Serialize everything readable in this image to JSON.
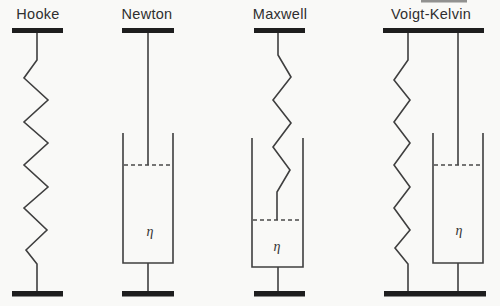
{
  "figure": {
    "background_color": "#f9f9f7",
    "line_color": "#3f3f3f",
    "bar_color": "#1e1e1e"
  },
  "models": [
    {
      "id": "hooke",
      "label": "Hooke",
      "elements": [
        "spring"
      ]
    },
    {
      "id": "newton",
      "label": "Newton",
      "elements": [
        "dashpot"
      ],
      "viscosity_label": "η"
    },
    {
      "id": "maxwell",
      "label": "Maxwell",
      "elements": [
        "spring",
        "dashpot"
      ],
      "arrangement": "series",
      "viscosity_label": "η"
    },
    {
      "id": "voigt-kelvin",
      "label": "Voigt-Kelvin",
      "elements": [
        "spring",
        "dashpot"
      ],
      "arrangement": "parallel",
      "viscosity_label": "η"
    }
  ]
}
